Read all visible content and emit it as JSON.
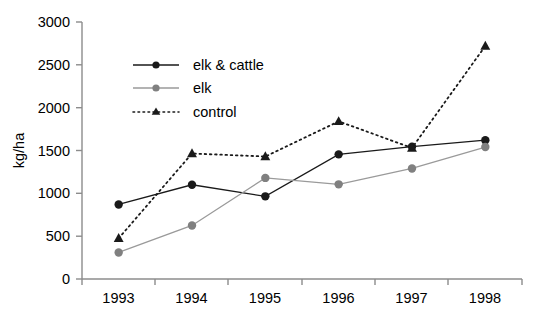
{
  "chart_data": {
    "type": "line",
    "title": "",
    "xlabel": "",
    "ylabel": "kg/ha",
    "categories": [
      "1993",
      "1994",
      "1995",
      "1996",
      "1997",
      "1998"
    ],
    "ylim": [
      0,
      3000
    ],
    "yticks": [
      0,
      500,
      1000,
      1500,
      2000,
      2500,
      3000
    ],
    "grid": false,
    "legend_position": "upper-left-inside",
    "series": [
      {
        "name": "elk & cattle",
        "values": [
          870,
          1100,
          965,
          1455,
          1545,
          1620
        ],
        "color": "#1a1a1a",
        "marker": "circle",
        "linestyle": "solid"
      },
      {
        "name": "elk",
        "values": [
          310,
          625,
          1180,
          1105,
          1290,
          1540
        ],
        "color": "#808080",
        "marker": "circle",
        "linestyle": "solid"
      },
      {
        "name": "control",
        "values": [
          475,
          1465,
          1430,
          1840,
          1530,
          2720
        ],
        "color": "#1a1a1a",
        "marker": "triangle",
        "linestyle": "dotted"
      }
    ]
  },
  "axes": {
    "y_title": "kg/ha",
    "y_tick_labels": [
      "3000",
      "2500",
      "2000",
      "1500",
      "1000",
      "500",
      "0"
    ],
    "x_tick_labels": [
      "1993",
      "1994",
      "1995",
      "1996",
      "1997",
      "1998"
    ]
  },
  "legend": {
    "items": [
      {
        "label": "elk & cattle"
      },
      {
        "label": "elk"
      },
      {
        "label": "control"
      }
    ]
  }
}
